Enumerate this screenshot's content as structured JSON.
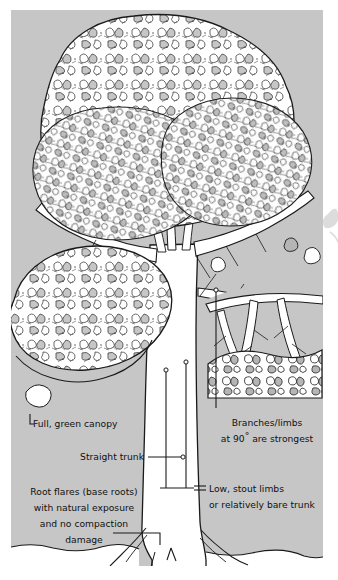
{
  "figure": {
    "background_color": "#ffffff",
    "field_color": "#c6c6c6",
    "ink_color": "#111111",
    "trunk_color": "#ffffff",
    "field": {
      "x": 11,
      "y": 10,
      "width": 312,
      "height": 556
    }
  },
  "annotations": {
    "canopy": {
      "label": "Full, green canopy",
      "x": 33,
      "y": 427,
      "anchor": "start"
    },
    "trunk": {
      "label": "Straight trunk",
      "x": 144,
      "y": 460,
      "anchor": "end"
    },
    "roots": {
      "line1": "Root flares (base roots)",
      "line2": "with natural exposure",
      "line3": "and no compaction",
      "line4": "damage",
      "x": 84,
      "y": 495,
      "anchor": "middle",
      "line_height": 16
    },
    "branches": {
      "line1": "Branches/limbs",
      "line2_pre": "at 90",
      "line2_deg": "°",
      "line2_post": " are strongest",
      "x": 267,
      "y": 426,
      "anchor": "middle",
      "line_height": 16
    },
    "limbs": {
      "line1": "Low, stout limbs",
      "line2": "or relatively bare trunk",
      "x": 209,
      "y": 492,
      "anchor": "start",
      "line_height": 16
    }
  },
  "colors": {
    "field_grey": "#c6c6c6",
    "mid_grey": "#a9a9a9",
    "dark_grey": "#6f6f6f",
    "ink": "#111111",
    "paper": "#ffffff"
  }
}
